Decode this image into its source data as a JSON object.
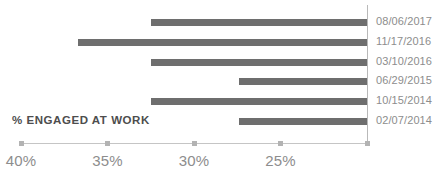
{
  "chart_data": {
    "type": "bar",
    "orientation": "horizontal",
    "title": "",
    "subtitle": "",
    "xlabel": "% ENGAGED AT WORK",
    "ylabel": "",
    "categories": [
      "08/06/2017",
      "11/17/2016",
      "03/10/2016",
      "06/29/2015",
      "10/15/2014",
      "02/07/2014"
    ],
    "values": [
      32.5,
      36.7,
      32.5,
      27.4,
      32.5,
      27.4
    ],
    "bar_baseline": 20.0,
    "unit": "%",
    "xlim": [
      40,
      20
    ],
    "axis_reversed": true,
    "tick_values": [
      40,
      35,
      30,
      25,
      20
    ],
    "tick_labels": [
      "40%",
      "35%",
      "30%",
      "25%",
      ""
    ],
    "grid": false,
    "legend": "none",
    "series_label_position": "right",
    "colors": {
      "bar": "#6e6e6e",
      "axis_line": "#c5c5c5",
      "value_axis_line": "#b9b9b9",
      "tick_mark": "#b3b3b3",
      "tick_label": "#8d8d8d",
      "series_label": "#8d8d8d",
      "axis_title": "#4d4d4d",
      "background": "#ffffff"
    }
  },
  "axis_title": {
    "text": "% ENGAGED AT WORK"
  },
  "ticks": [
    {
      "label": "40%",
      "value": 40
    },
    {
      "label": "35%",
      "value": 35
    },
    {
      "label": "30%",
      "value": 30
    },
    {
      "label": "25%",
      "value": 25
    },
    {
      "label": "",
      "value": 20
    }
  ],
  "bars": [
    {
      "label": "08/06/2017",
      "value": 32.5
    },
    {
      "label": "11/17/2016",
      "value": 36.7
    },
    {
      "label": "03/10/2016",
      "value": 32.5
    },
    {
      "label": "06/29/2015",
      "value": 27.4
    },
    {
      "label": "10/15/2014",
      "value": 32.5
    },
    {
      "label": "02/07/2014",
      "value": 27.4
    }
  ]
}
